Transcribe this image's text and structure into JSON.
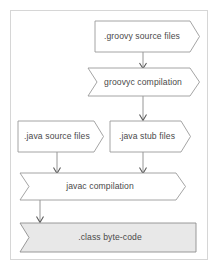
{
  "diagram": {
    "frame": {
      "border_color": "#d6d6d6"
    },
    "colors": {
      "node_stroke": "#9a9a9a",
      "node_fill": "#ffffff",
      "highlight_fill": "#e8e8e8",
      "connector": "#8a8a8a",
      "text": "#4a4a4a"
    },
    "nodes": [
      {
        "id": "groovy-source-files",
        "label": ".groovy source files",
        "shape": "arrow-right",
        "fill": "white"
      },
      {
        "id": "groovyc-compilation",
        "label": "groovyc compilation",
        "shape": "chevron",
        "fill": "white"
      },
      {
        "id": "java-source-files",
        "label": ".java source files",
        "shape": "arrow-right",
        "fill": "white"
      },
      {
        "id": "java-stub-files",
        "label": ".java stub files",
        "shape": "arrow-right",
        "fill": "white"
      },
      {
        "id": "javac-compilation",
        "label": "javac compilation",
        "shape": "chevron",
        "fill": "white"
      },
      {
        "id": "class-byte-code",
        "label": ".class byte-code",
        "shape": "chevron-flat-right",
        "fill": "gray"
      }
    ],
    "edges": [
      {
        "id": "edge-groovy-to-groovyc",
        "from": "groovy-source-files",
        "to": "groovyc-compilation"
      },
      {
        "id": "edge-groovyc-to-stub",
        "from": "groovyc-compilation",
        "to": "java-stub-files"
      },
      {
        "id": "edge-javasource-to-javac",
        "from": "java-source-files",
        "to": "javac-compilation"
      },
      {
        "id": "edge-stub-to-javac",
        "from": "java-stub-files",
        "to": "javac-compilation"
      },
      {
        "id": "edge-javac-to-class",
        "from": "javac-compilation",
        "to": "class-byte-code"
      }
    ]
  }
}
